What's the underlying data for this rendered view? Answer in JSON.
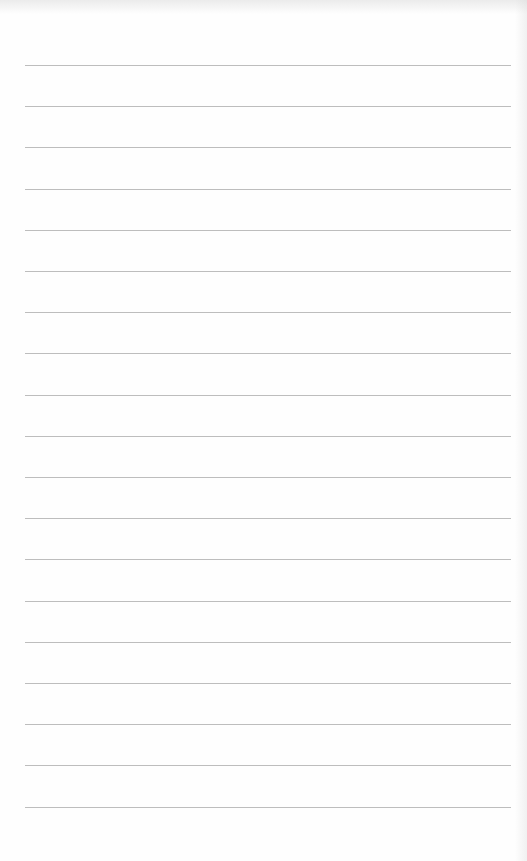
{
  "page": {
    "type": "lined-paper",
    "line_count": 19,
    "line_color": "#bdbdbd",
    "background_color": "#fefefe",
    "text": []
  }
}
